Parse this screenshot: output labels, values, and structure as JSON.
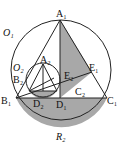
{
  "figure": {
    "labels": {
      "A1": "A₁",
      "B1": "B₁",
      "C1": "C₁",
      "D1": "D₁",
      "E1": "E₁",
      "A2": "A₂",
      "B2": "B₂",
      "C2": "C₂",
      "D2": "D₂",
      "E2": "E₂",
      "O1": "O₁",
      "O2": "O₂",
      "caption": "R₂"
    },
    "colors": {
      "stroke": "#222222",
      "shade": "#a8a8a8"
    }
  }
}
